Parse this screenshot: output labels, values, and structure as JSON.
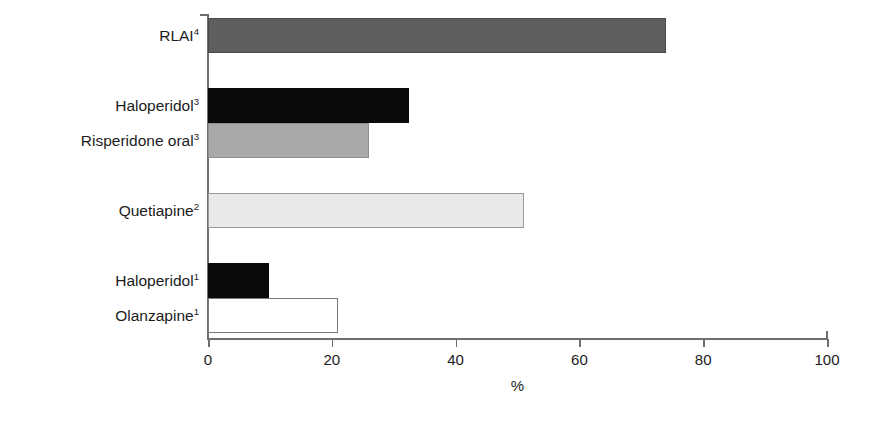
{
  "chart_data": {
    "type": "bar",
    "orientation": "horizontal",
    "title": "",
    "subtitle": "",
    "xlabel": "%",
    "ylabel": "",
    "xlim": [
      0,
      100
    ],
    "ylim": null,
    "xticks": [
      0,
      20,
      40,
      60,
      80,
      100
    ],
    "xtick_labels": [
      "0",
      "20",
      "40",
      "60",
      "80",
      "100"
    ],
    "grid": false,
    "legend": null,
    "legend_position": "none",
    "categories": [
      "RLAI⁴",
      "Haloperidol³",
      "Risperidone oral³",
      "Quetiapine²",
      "Haloperidol¹",
      "Olanzapine¹"
    ],
    "values": [
      74,
      32.5,
      26,
      51,
      9.8,
      21
    ],
    "bars": [
      {
        "label": "RLAI",
        "superscript": "4",
        "value": 74,
        "fill": "#5e5e5e",
        "stroke": "#4a4a4a",
        "group": 0
      },
      {
        "label": "Haloperidol",
        "superscript": "3",
        "value": 32.5,
        "fill": "#0a0a0a",
        "stroke": "#0a0a0a",
        "group": 1
      },
      {
        "label": "Risperidone oral",
        "superscript": "3",
        "value": 26,
        "fill": "#a9a9a9",
        "stroke": "#8f8f8f",
        "group": 1
      },
      {
        "label": "Quetiapine",
        "superscript": "2",
        "value": 51,
        "fill": "#e9e9e9",
        "stroke": "#9a9a9a",
        "group": 2
      },
      {
        "label": "Haloperidol",
        "superscript": "1",
        "value": 9.8,
        "fill": "#0a0a0a",
        "stroke": "#0a0a0a",
        "group": 3
      },
      {
        "label": "Olanzapine",
        "superscript": "1",
        "value": 21,
        "fill": "#ffffff",
        "stroke": "#7a7a7a",
        "group": 3
      }
    ],
    "colors": {
      "axis": "#6e6e6e",
      "text": "#1b1b1b",
      "background": "#ffffff"
    }
  },
  "axis": {
    "x_title": "%",
    "ticks": [
      {
        "value": "0"
      },
      {
        "value": "20"
      },
      {
        "value": "40"
      },
      {
        "value": "60"
      },
      {
        "value": "80"
      },
      {
        "value": "100"
      }
    ]
  }
}
